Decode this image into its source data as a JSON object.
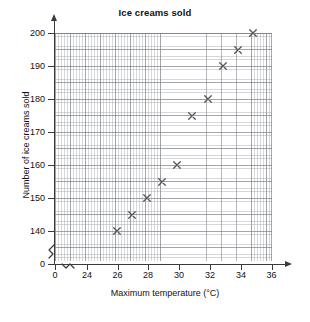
{
  "chart_data": {
    "type": "scatter",
    "title": "Ice creams sold",
    "xlabel": "Maximum temperature (°C)",
    "ylabel": "Number of ice creams sold",
    "x": [
      26,
      27,
      28,
      29,
      30,
      31,
      32,
      33,
      34,
      35
    ],
    "values": [
      140,
      145,
      150,
      155,
      160,
      175,
      180,
      190,
      195,
      200
    ],
    "points": [
      {
        "x": 26,
        "y": 140
      },
      {
        "x": 27,
        "y": 145
      },
      {
        "x": 28,
        "y": 150
      },
      {
        "x": 29,
        "y": 155
      },
      {
        "x": 30,
        "y": 160
      },
      {
        "x": 31,
        "y": 175
      },
      {
        "x": 32,
        "y": 180
      },
      {
        "x": 33,
        "y": 190
      },
      {
        "x": 34,
        "y": 195
      },
      {
        "x": 35,
        "y": 200
      }
    ],
    "marker": "x-cross",
    "marker_color": "#555555",
    "grid": true,
    "grid_minor": true,
    "legend": null,
    "xlim": [
      24,
      36
    ],
    "ylim": [
      135,
      200
    ],
    "x_ticks": [
      0,
      24,
      26,
      28,
      30,
      32,
      34,
      36
    ],
    "y_ticks": [
      0,
      140,
      150,
      160,
      170,
      180,
      190,
      200
    ],
    "x_axis_break": true,
    "y_axis_break": true,
    "x_tick_labels": [
      "0",
      "24",
      "26",
      "28",
      "30",
      "32",
      "34",
      "36"
    ],
    "y_tick_labels": [
      "0",
      "140",
      "150",
      "160",
      "170",
      "180",
      "190",
      "200"
    ]
  },
  "axis_colors": {
    "axis": "#3a3a3a",
    "grid_major": "#787c84",
    "grid_minor": "#969ba2",
    "text": "#111111"
  }
}
